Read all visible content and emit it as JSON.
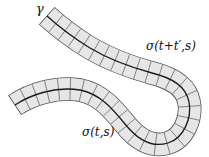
{
  "diagram": {
    "labels": {
      "curve": "γ",
      "flow_later": "σ(t+t′,s)",
      "flow_now": "σ(t,s)"
    },
    "colors": {
      "band_fill": "#e6e6e6",
      "band_edge": "#555555",
      "center_line": "#1a1a1a",
      "cell_lines": "#666666",
      "text": "#111111"
    },
    "cells_count": 34
  }
}
